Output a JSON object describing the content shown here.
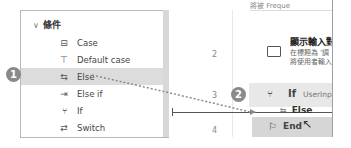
{
  "sidebar": {
    "group": {
      "chevron": "∨",
      "label": "條件"
    },
    "items": [
      {
        "icon": "case-icon",
        "glyph": "⊟",
        "label": "Case"
      },
      {
        "icon": "default-case-icon",
        "glyph": "⊤",
        "label": "Default case"
      },
      {
        "icon": "else-icon",
        "glyph": "⇆",
        "label": "Else",
        "selected": true
      },
      {
        "icon": "else-if-icon",
        "glyph": "⇥",
        "label": "Else if"
      },
      {
        "icon": "if-icon",
        "glyph": "⑂",
        "label": "If"
      },
      {
        "icon": "switch-icon",
        "glyph": "⇄",
        "label": "Switch"
      }
    ]
  },
  "callouts": {
    "step1": "1",
    "step2": "2"
  },
  "editor": {
    "top_text": "將被 Freque",
    "line_numbers": [
      "2",
      "3",
      "4"
    ],
    "action": {
      "title": "顯示輸入對",
      "desc1": "在標題為 '調",
      "desc2": "將使用者輸入"
    },
    "if_row": {
      "label": "If",
      "condition": "UserInput"
    },
    "drag_ghost": {
      "label": "Else"
    },
    "end_row": {
      "label": "End"
    }
  }
}
